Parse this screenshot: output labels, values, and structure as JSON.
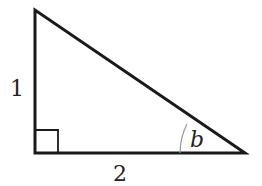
{
  "diagram": {
    "type": "right-triangle",
    "vertices": {
      "top": [
        35,
        10
      ],
      "right_angle": [
        35,
        153
      ],
      "right": [
        245,
        153
      ]
    },
    "labels": {
      "vertical_side": "1",
      "horizontal_side": "2",
      "angle": "b"
    },
    "colors": {
      "stroke": "#1a1a1a",
      "arc": "#999999"
    }
  }
}
